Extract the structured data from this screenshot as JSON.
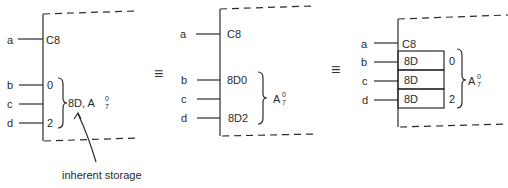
{
  "diagram": {
    "equivalence_symbol": "≡",
    "panel1": {
      "inputs": [
        "a",
        "b",
        "c",
        "d"
      ],
      "control_label": "C8",
      "bit_labels": [
        "0",
        "2"
      ],
      "group_label": "8D, A",
      "group_sup": "0",
      "group_sub": "7",
      "annotation": "inherent storage"
    },
    "panel2": {
      "inputs": [
        "a",
        "b",
        "c",
        "d"
      ],
      "control_label": "C8",
      "data_labels": [
        "8D0",
        "8D2"
      ],
      "group_label": "A",
      "group_sup": "0",
      "group_sub": "7"
    },
    "panel3": {
      "inputs": [
        "a",
        "b",
        "c",
        "d"
      ],
      "control_label": "C8",
      "cell_labels": [
        "8D",
        "8D",
        "8D"
      ],
      "bit_labels": [
        "0",
        "2"
      ],
      "group_label": "A",
      "group_sup": "0",
      "group_sub": "7"
    }
  }
}
